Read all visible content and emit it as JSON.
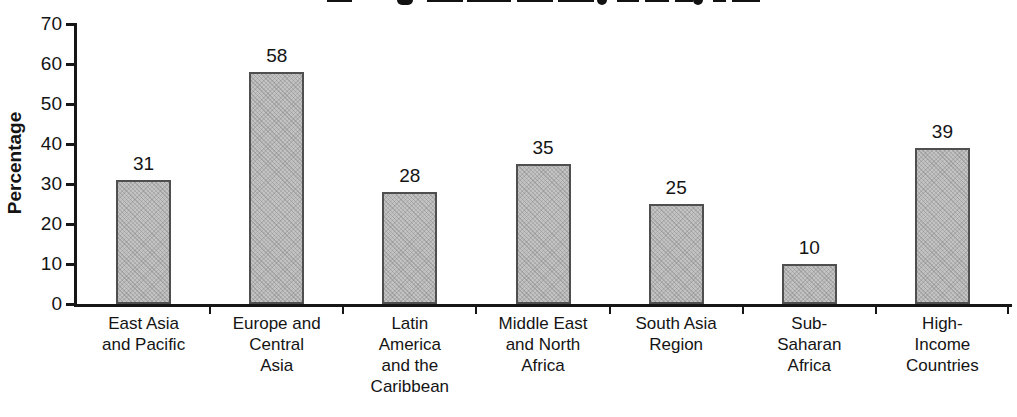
{
  "chart_data": {
    "type": "bar",
    "title": "",
    "cropped_title": {
      "visible": true,
      "legible": false
    },
    "xlabel": "",
    "ylabel": "Percentage",
    "ylim": [
      0,
      70
    ],
    "yticks": [
      0,
      10,
      20,
      30,
      40,
      50,
      60,
      70
    ],
    "grid": false,
    "legend": false,
    "categories": [
      "East Asia and Pacific",
      "Europe and Central Asia",
      "Latin America and the Caribbean",
      "Middle East and North Africa",
      "South Asia Region",
      "Sub-Saharan Africa",
      "High-Income Countries"
    ],
    "category_label_lines": [
      [
        "East Asia",
        "and Pacific"
      ],
      [
        "Europe and",
        "Central",
        "Asia"
      ],
      [
        "Latin",
        "America",
        "and the",
        "Caribbean"
      ],
      [
        "Middle East",
        "and North",
        "Africa"
      ],
      [
        "South Asia",
        "Region"
      ],
      [
        "Sub-",
        "Saharan",
        "Africa"
      ],
      [
        "High-",
        "Income",
        "Countries"
      ]
    ],
    "values": [
      31,
      58,
      28,
      35,
      25,
      10,
      39
    ],
    "bar_value_labels": [
      "31",
      "58",
      "28",
      "35",
      "25",
      "10",
      "39"
    ],
    "colors": {
      "bar_fill": "#c3c3c3",
      "bar_border": "#4f4f4f",
      "axis": "#161616",
      "text": "#141414",
      "background": "#ffffff"
    }
  }
}
